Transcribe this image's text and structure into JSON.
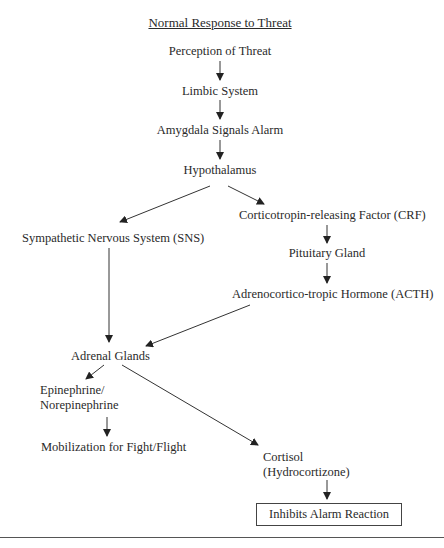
{
  "title": "Normal Response to Threat",
  "nodes": {
    "perception": "Perception of Threat",
    "limbic": "Limbic System",
    "amygdala": "Amygdala Signals Alarm",
    "hypothalamus": "Hypothalamus",
    "crf": "Corticotropin-releasing Factor (CRF)",
    "sns": "Sympathetic Nervous System (SNS)",
    "pituitary": "Pituitary Gland",
    "acth": "Adrenocortico-tropic Hormone (ACTH)",
    "adrenal": "Adrenal Glands",
    "epi_line1": "Epinephrine/",
    "epi_line2": "Norepinephrine",
    "mobilization": "Mobilization for Fight/Flight",
    "cortisol_line1": "Cortisol",
    "cortisol_line2": "(Hydrocortizone)",
    "inhibits": "Inhibits Alarm Reaction"
  },
  "edges": [
    [
      "perception",
      "limbic"
    ],
    [
      "limbic",
      "amygdala"
    ],
    [
      "amygdala",
      "hypothalamus"
    ],
    [
      "hypothalamus",
      "sns"
    ],
    [
      "hypothalamus",
      "crf"
    ],
    [
      "crf",
      "pituitary"
    ],
    [
      "pituitary",
      "acth"
    ],
    [
      "sns",
      "adrenal"
    ],
    [
      "acth",
      "adrenal"
    ],
    [
      "adrenal",
      "epinephrine"
    ],
    [
      "adrenal",
      "cortisol"
    ],
    [
      "epinephrine",
      "mobilization"
    ],
    [
      "cortisol",
      "inhibits"
    ]
  ]
}
